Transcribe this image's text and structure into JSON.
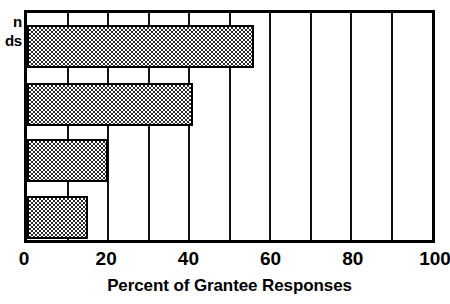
{
  "chart_data": {
    "type": "bar",
    "orientation": "horizontal",
    "title": "",
    "xlabel": "Percent of Grantee Responses",
    "ylabel": "",
    "xlim": [
      0,
      100
    ],
    "xticks": [
      0,
      20,
      40,
      60,
      80,
      100
    ],
    "xtick_labels": [
      "0",
      "20",
      "40",
      "60",
      "80",
      "100"
    ],
    "grid": true,
    "gridline_interval": 10,
    "legend": "none",
    "categories": [
      "",
      "",
      "",
      ""
    ],
    "values": [
      56,
      41,
      20,
      15
    ],
    "series": [
      {
        "name": "Percent of Grantee Responses",
        "values": [
          56,
          41,
          20,
          15
        ]
      }
    ],
    "bars": [
      {
        "index": 0,
        "label": "",
        "value": 56
      },
      {
        "index": 1,
        "label": "",
        "value": 41
      },
      {
        "index": 2,
        "label": "",
        "value": 20
      },
      {
        "index": 3,
        "label": "",
        "value": 15
      }
    ],
    "bar_fill": "checkerboard-hatch",
    "bar_fill_color": "#2b2b2b",
    "bar_edge_color": "#000000",
    "frame_color": "#000000",
    "background": "#ffffff"
  },
  "category_labels_cropped": {
    "line1": "n",
    "line2": "ds"
  },
  "axis": {
    "x_title": "Percent of Grantee Responses",
    "ticks": [
      {
        "value": 0,
        "label": "0"
      },
      {
        "value": 20,
        "label": "20"
      },
      {
        "value": 40,
        "label": "40"
      },
      {
        "value": 60,
        "label": "60"
      },
      {
        "value": 80,
        "label": "80"
      },
      {
        "value": 100,
        "label": "100"
      }
    ]
  }
}
